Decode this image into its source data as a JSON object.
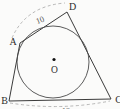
{
  "figure": {
    "type": "geometry-diagram",
    "labels": {
      "vertex_a": "A",
      "vertex_b": "B",
      "vertex_c": "C",
      "vertex_d": "D",
      "center": "O"
    },
    "measurements": {
      "side_ad": "10",
      "side_bc_clipped": "12"
    },
    "colors": {
      "outline": "#3b3b3b",
      "circle": "#4a4a4a",
      "dashed_arc": "#9a9a9a",
      "text": "#2d2d2d",
      "background": "#fbfbfa"
    }
  }
}
